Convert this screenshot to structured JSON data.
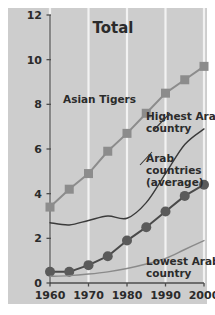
{
  "chart": {
    "title": "Total",
    "background_color": "#cdcdcd",
    "page_background": "#ffffff",
    "axis_color": "#4d4d4d",
    "gridline_color": "#f2f2f2"
  },
  "chart_data": {
    "type": "line",
    "title": "Total",
    "xlabel": "",
    "ylabel": "",
    "xlim": [
      1958,
      2001
    ],
    "ylim": [
      0,
      12
    ],
    "yticks": [
      0,
      2,
      4,
      6,
      8,
      10,
      12
    ],
    "xticks": [
      1960,
      1970,
      1980,
      1990,
      2000
    ],
    "grid": true,
    "grid_axis": "x",
    "legend": "inline-annotations",
    "series": [
      {
        "name": "Asian Tigers",
        "marker": "square",
        "color": "#8c8c8c",
        "line_color": "#8c8c8c",
        "x": [
          1960,
          1965,
          1970,
          1975,
          1980,
          1985,
          1990,
          1995,
          2000
        ],
        "values": [
          3.4,
          4.2,
          4.9,
          5.9,
          6.7,
          7.6,
          8.5,
          9.1,
          9.7
        ]
      },
      {
        "name": "Highest Arab country",
        "marker": "none",
        "color": "#3a3a3a",
        "line_color": "#3a3a3a",
        "x": [
          1960,
          1965,
          1970,
          1975,
          1980,
          1985,
          1990,
          1995,
          2000
        ],
        "values": [
          2.7,
          2.6,
          2.8,
          3.0,
          2.9,
          3.6,
          4.9,
          6.2,
          6.9
        ]
      },
      {
        "name": "Arab countries (average)",
        "marker": "circle",
        "color": "#5a5a5a",
        "line_color": "#4a4a4a",
        "x": [
          1960,
          1965,
          1970,
          1975,
          1980,
          1985,
          1990,
          1995,
          2000
        ],
        "values": [
          0.5,
          0.5,
          0.8,
          1.2,
          1.9,
          2.5,
          3.2,
          3.9,
          4.4
        ]
      },
      {
        "name": "Lowest Arab country",
        "marker": "none",
        "color": "#8a8a8a",
        "line_color": "#8a8a8a",
        "x": [
          1960,
          1965,
          1970,
          1975,
          1980,
          1985,
          1990,
          1995,
          2000
        ],
        "values": [
          0.3,
          0.33,
          0.4,
          0.5,
          0.65,
          0.85,
          1.1,
          1.5,
          1.9
        ]
      }
    ],
    "annotations": [
      {
        "name": "asian-tigers",
        "text": "Asian Tigers",
        "lines": [
          "Asian Tigers"
        ],
        "x": 63,
        "y": 103
      },
      {
        "name": "highest-arab-country",
        "text": "Highest Arab country",
        "lines": [
          "Highest Arab",
          "country"
        ],
        "x": 146,
        "y": 120
      },
      {
        "name": "arab-countries-average",
        "text": "Arab countries (average)",
        "lines": [
          "Arab",
          "countries",
          "(average)"
        ],
        "x": 146,
        "y": 162
      },
      {
        "name": "lowest-arab-country",
        "text": "Lowest Arab country",
        "lines": [
          "Lowest Arab",
          "country"
        ],
        "x": 146,
        "y": 265
      }
    ]
  }
}
